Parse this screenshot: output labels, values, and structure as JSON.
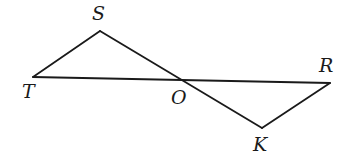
{
  "diagram": {
    "type": "geometry",
    "stroke_color": "#1a1a1a",
    "background": "#ffffff",
    "points": {
      "T": {
        "label": "T",
        "x": 33,
        "y": 77,
        "lx": 22,
        "ly": 98
      },
      "S": {
        "label": "S",
        "x": 100,
        "y": 31,
        "lx": 92,
        "ly": 20
      },
      "O": {
        "label": "O",
        "x": 180,
        "y": 80,
        "lx": 171,
        "ly": 104
      },
      "R": {
        "label": "R",
        "x": 330,
        "y": 83,
        "lx": 319,
        "ly": 72
      },
      "K": {
        "label": "K",
        "x": 262,
        "y": 128,
        "lx": 253,
        "ly": 151
      }
    },
    "segments": [
      {
        "name": "segment-TS",
        "from": "T",
        "to": "S"
      },
      {
        "name": "segment-SK",
        "from": "S",
        "to": "K"
      },
      {
        "name": "segment-TR",
        "from": "T",
        "to": "R"
      },
      {
        "name": "segment-RK",
        "from": "R",
        "to": "K"
      }
    ]
  }
}
